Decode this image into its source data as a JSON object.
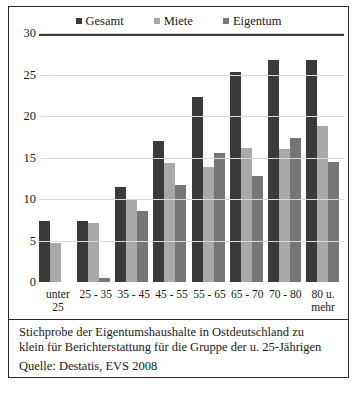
{
  "chart_data": {
    "type": "bar",
    "title": "",
    "xlabel": "",
    "ylabel": "",
    "ylim": [
      0,
      30
    ],
    "yticks": [
      0,
      5,
      10,
      15,
      20,
      25,
      30
    ],
    "grid": true,
    "legend_position": "top-center",
    "categories": [
      "unter 25",
      "25 - 35",
      "35 - 45",
      "45 - 55",
      "55 - 65",
      "65 - 70",
      "70 - 80",
      "80 u. mehr"
    ],
    "series": [
      {
        "name": "Gesamt",
        "color": "#3a3a3a",
        "values": [
          7.3,
          7.4,
          11.4,
          17.0,
          22.3,
          25.3,
          26.8,
          26.7
        ]
      },
      {
        "name": "Miete",
        "color": "#a9a9a9",
        "values": [
          4.7,
          7.1,
          9.9,
          14.3,
          13.8,
          16.2,
          16.0,
          18.8
        ]
      },
      {
        "name": "Eigentum",
        "color": "#767676",
        "values": [
          null,
          0.5,
          8.5,
          11.7,
          15.6,
          12.8,
          17.4,
          14.5
        ]
      }
    ],
    "annotations": [
      "Stichprobe der Eigentumshaushalte in Ostdeutschland zu klein für Berichterstattung  für die Gruppe der u. 25-Jährigen"
    ],
    "source": "Quelle: Destatis, EVS 2008"
  },
  "legend": {
    "items": [
      {
        "label": "Gesamt",
        "color": "#3a3a3a"
      },
      {
        "label": "Miete",
        "color": "#a9a9a9"
      },
      {
        "label": "Eigentum",
        "color": "#767676"
      }
    ]
  },
  "notes": {
    "footnote_line1": "Stichprobe der Eigentumshaushalte in Ostdeutschland zu",
    "footnote_line2": "klein für Berichterstattung  für die Gruppe der u. 25-Jährigen",
    "source": "Quelle: Destatis, EVS 2008"
  },
  "xlabels": [
    {
      "line1": "unter",
      "line2": "25"
    },
    {
      "line1": "25 - 35",
      "line2": ""
    },
    {
      "line1": "35 - 45",
      "line2": ""
    },
    {
      "line1": "45 - 55",
      "line2": ""
    },
    {
      "line1": "55 - 65",
      "line2": ""
    },
    {
      "line1": "65 - 70",
      "line2": ""
    },
    {
      "line1": "70 - 80",
      "line2": ""
    },
    {
      "line1": "80 u.",
      "line2": "mehr"
    }
  ]
}
